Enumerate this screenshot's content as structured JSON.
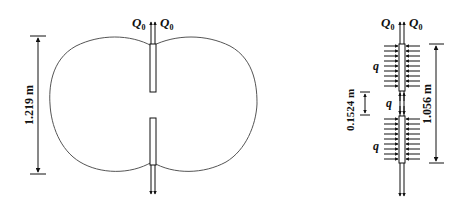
{
  "figure_left": {
    "flow_labels": [
      "Q",
      "Q"
    ],
    "flow_subscript": "0",
    "height_dimension": "1.219 m"
  },
  "figure_right": {
    "flow_labels": [
      "Q",
      "Q"
    ],
    "flow_subscript": "0",
    "lateral_flux_label": "q",
    "gap_dimension": "0.1524 m",
    "screen_dimension": "1.056 m"
  },
  "colors": {
    "line": "#111111",
    "outline": "#555555",
    "background": "#ffffff"
  }
}
